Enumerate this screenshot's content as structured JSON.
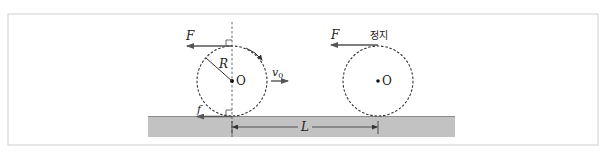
{
  "figure": {
    "frame": {
      "x": 8,
      "y": 14,
      "w": 590,
      "h": 131,
      "stroke": "#cfcfcf"
    },
    "ground": {
      "x": 148,
      "y": 116,
      "w": 307,
      "h": 21,
      "fill": "#c2c2c2",
      "edge": "#8a8a8a"
    },
    "colors": {
      "line": "#333333",
      "arrow": "#555555",
      "dashed": "#444444"
    },
    "left_wheel": {
      "center_label": "O",
      "radius_label": "R",
      "force_top_label": "F",
      "friction_label": "f",
      "velocity_label": "v",
      "velocity_subscript": "0"
    },
    "right_wheel": {
      "center_label": "O",
      "force_top_label": "F",
      "state_label": "정지"
    },
    "distance_label": "L"
  }
}
